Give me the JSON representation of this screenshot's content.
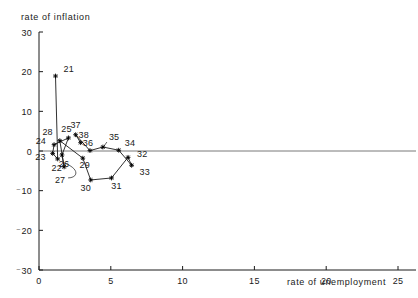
{
  "chart_data": {
    "type": "scatter",
    "title": "",
    "xlabel": "rate of unemployment",
    "ylabel": "rate of inflation",
    "xlim": [
      0,
      25
    ],
    "ylim": [
      -30,
      30
    ],
    "xticks": [
      0,
      5,
      10,
      15,
      20,
      25
    ],
    "yticks": [
      30,
      20,
      10,
      0,
      -10,
      -20,
      -30
    ],
    "xtick_labels": [
      "0",
      "5",
      "10",
      "15",
      "20",
      "25"
    ],
    "ytick_labels": [
      "30",
      "20",
      "10",
      "0",
      "⁻10",
      "⁻20",
      "⁻30"
    ],
    "grid": false,
    "legend": null,
    "connected": true,
    "zero_reference_line": true,
    "points": [
      {
        "label": "21",
        "x": 1.15,
        "y": 18.9
      },
      {
        "label": "22",
        "x": 1.3,
        "y": -2.0
      },
      {
        "label": "23",
        "x": 0.95,
        "y": -0.6
      },
      {
        "label": "24",
        "x": 1.05,
        "y": 1.6
      },
      {
        "label": "25",
        "x": 2.05,
        "y": 3.3
      },
      {
        "label": "26",
        "x": 1.6,
        "y": -1.0
      },
      {
        "label": "27",
        "x": 1.75,
        "y": -4.0
      },
      {
        "label": "28",
        "x": 1.45,
        "y": 2.6
      },
      {
        "label": "29",
        "x": 3.05,
        "y": -1.8
      },
      {
        "label": "30",
        "x": 3.6,
        "y": -7.3
      },
      {
        "label": "31",
        "x": 5.05,
        "y": -6.8
      },
      {
        "label": "32",
        "x": 6.2,
        "y": -1.6
      },
      {
        "label": "33",
        "x": 6.45,
        "y": -3.6
      },
      {
        "label": "34",
        "x": 5.55,
        "y": 0.2
      },
      {
        "label": "35",
        "x": 4.45,
        "y": 1.0
      },
      {
        "label": "36",
        "x": 3.55,
        "y": 0.1
      },
      {
        "label": "37",
        "x": 2.55,
        "y": 4.1
      },
      {
        "label": "38",
        "x": 2.9,
        "y": 2.1
      }
    ],
    "path_order": [
      "21",
      "22",
      "23",
      "24",
      "25",
      "26",
      "27",
      "28",
      "29",
      "30",
      "31",
      "32",
      "33",
      "34",
      "35",
      "36",
      "37",
      "38"
    ]
  }
}
